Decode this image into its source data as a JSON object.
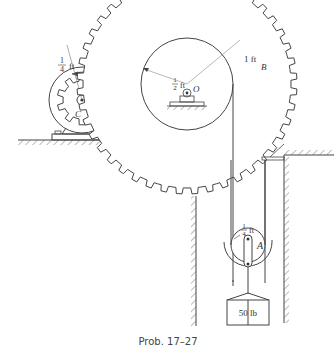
{
  "figure": {
    "caption": "Prob. 17–27",
    "colors": {
      "stroke": "#444444",
      "text": "#333333",
      "background": "#ffffff"
    }
  },
  "gear_c": {
    "label": "C",
    "radius_label_num": "1",
    "radius_label_den": "4",
    "radius_label_unit": "ft",
    "rotation_arrow": "counterclockwise-arrow"
  },
  "gear_b": {
    "label": "B",
    "outer_radius_label": "1 ft",
    "drum_radius_num": "1",
    "drum_radius_den": "2",
    "drum_radius_unit": "ft",
    "center_label": "O"
  },
  "pulley_a": {
    "label": "A",
    "radius_num": "1",
    "radius_den": "4",
    "radius_unit": "ft"
  },
  "weight": {
    "label": "50 lb"
  }
}
